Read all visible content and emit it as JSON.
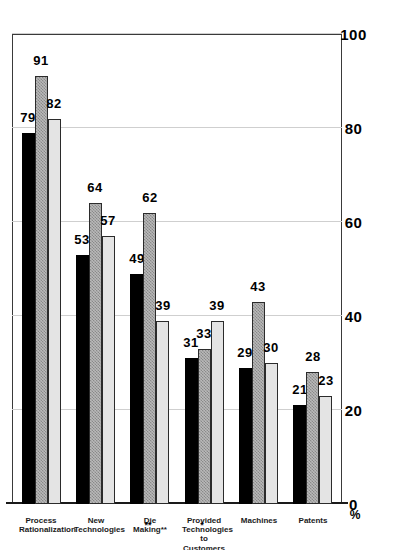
{
  "chart_data": {
    "type": "bar",
    "title": "",
    "subtitle": "",
    "orientation": "horizontal-rotated-page",
    "xlabel": "",
    "ylabel": "%",
    "unit_label": "%",
    "ylim": [
      0,
      100
    ],
    "grid": true,
    "legend_position": "top-left",
    "tick_labels": [
      "0",
      "20",
      "40",
      "60",
      "80",
      "100"
    ],
    "tick_values": [
      0,
      20,
      40,
      60,
      80,
      100
    ],
    "categories": [
      "Process\nRationalization",
      "New\nTechnologies",
      "Die Making**",
      "Provided Technologies\nto Customers",
      "Machines",
      "Patents"
    ],
    "series": [
      {
        "name": "Manufacturing*",
        "color": "#000000",
        "pattern": "solid",
        "values": [
          79,
          53,
          49,
          31,
          29,
          21
        ]
      },
      {
        "name": "Automotive",
        "color": "#b9b9b9",
        "pattern": "checkered",
        "values": [
          91,
          64,
          62,
          33,
          43,
          28
        ]
      },
      {
        "name": "Electronics",
        "color": "#e4e4e4",
        "pattern": "light",
        "values": [
          82,
          57,
          39,
          39,
          30,
          23
        ]
      }
    ],
    "annotations": {
      "footnote_markers": [
        "*",
        "**"
      ]
    }
  },
  "legend": {
    "items": [
      {
        "label": "Manufacturing*"
      },
      {
        "label": "Automotive"
      },
      {
        "label": "Electronics"
      }
    ]
  },
  "axis": {
    "unit": "%",
    "ticks": [
      "100",
      "80",
      "60",
      "40",
      "20",
      "0"
    ]
  },
  "footnotes": {
    "marker_single": "*",
    "marker_double": "**"
  }
}
